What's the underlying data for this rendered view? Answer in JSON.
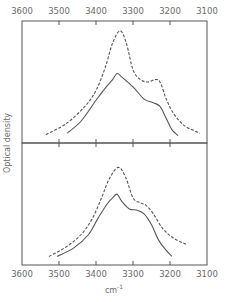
{
  "chart_data": [
    {
      "type": "line",
      "panel": "top",
      "title": "",
      "xlabel": "cm-1",
      "ylabel": "Optical density",
      "xlim": [
        3600,
        3100
      ],
      "x_ticks": [
        3600,
        3500,
        3400,
        3300,
        3200,
        3100
      ],
      "ylim": [
        0,
        1
      ],
      "grid": false,
      "series": [
        {
          "name": "dashed",
          "style": "dashed",
          "x": [
            3535,
            3480,
            3430,
            3400,
            3375,
            3355,
            3335,
            3318,
            3300,
            3280,
            3260,
            3240,
            3227,
            3210,
            3190,
            3160,
            3119
          ],
          "y": [
            0.07,
            0.16,
            0.3,
            0.43,
            0.62,
            0.82,
            0.92,
            0.82,
            0.6,
            0.52,
            0.5,
            0.52,
            0.5,
            0.36,
            0.24,
            0.14,
            0.08
          ]
        },
        {
          "name": "solid",
          "style": "solid",
          "x": [
            3478,
            3440,
            3400,
            3375,
            3355,
            3343,
            3330,
            3300,
            3270,
            3245,
            3227,
            3210,
            3195,
            3178
          ],
          "y": [
            0.08,
            0.18,
            0.35,
            0.45,
            0.52,
            0.57,
            0.54,
            0.46,
            0.36,
            0.33,
            0.3,
            0.2,
            0.11,
            0.06
          ]
        }
      ]
    },
    {
      "type": "line",
      "panel": "bottom",
      "title": "",
      "xlabel": "cm-1",
      "ylabel": "Optical density",
      "xlim": [
        3600,
        3100
      ],
      "x_ticks": [
        3600,
        3500,
        3400,
        3300,
        3200,
        3100
      ],
      "ylim": [
        0,
        1
      ],
      "grid": false,
      "series": [
        {
          "name": "dashed",
          "style": "dashed",
          "x": [
            3527,
            3480,
            3440,
            3410,
            3385,
            3365,
            3340,
            3320,
            3300,
            3280,
            3265,
            3245,
            3220,
            3190,
            3157
          ],
          "y": [
            0.07,
            0.15,
            0.25,
            0.38,
            0.55,
            0.7,
            0.8,
            0.72,
            0.55,
            0.51,
            0.49,
            0.42,
            0.3,
            0.22,
            0.17
          ]
        },
        {
          "name": "solid",
          "style": "solid",
          "x": [
            3505,
            3460,
            3420,
            3395,
            3370,
            3355,
            3343,
            3330,
            3310,
            3290,
            3270,
            3250,
            3230,
            3210,
            3195
          ],
          "y": [
            0.07,
            0.14,
            0.25,
            0.38,
            0.5,
            0.55,
            0.58,
            0.52,
            0.46,
            0.45,
            0.42,
            0.33,
            0.2,
            0.12,
            0.07
          ]
        }
      ]
    }
  ],
  "axes": {
    "top_ticks": [
      "3600",
      "3500",
      "3400",
      "3300",
      "3200",
      "3100"
    ],
    "bottom_ticks": [
      "3600",
      "3500",
      "3400",
      "3300",
      "3200",
      "3100"
    ],
    "xlabel": "cm",
    "xlabel_sup": "-1",
    "ylabel": "Optical density"
  },
  "colors": {
    "ink": "#555555",
    "label": "#6a6a6a",
    "background": "#ffffff"
  }
}
